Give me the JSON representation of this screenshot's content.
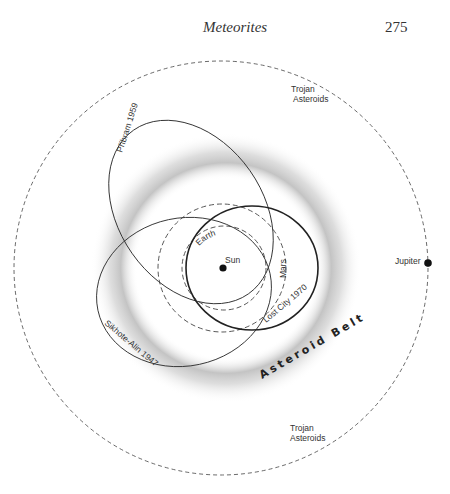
{
  "header": {
    "running_title": "Meteorites",
    "page_number": "275"
  },
  "diagram": {
    "labels": {
      "sun": "Sun",
      "earth": "Earth",
      "mars": "Mars",
      "jupiter": "Jupiter",
      "asteroid_belt": "Asteroid Belt",
      "trojan_top_line1": "Trojan",
      "trojan_top_line2": "Asteroids",
      "trojan_bottom_line1": "Trojan",
      "trojan_bottom_line2": "Asteroids",
      "pribram": "Příbram 1959",
      "sikhote_alin": "Sikhote-Alin 1947",
      "lost_city": "Lost City 1970"
    },
    "colors": {
      "line": "#333333",
      "belt": "#c8c8c8",
      "background": "#ffffff"
    }
  }
}
